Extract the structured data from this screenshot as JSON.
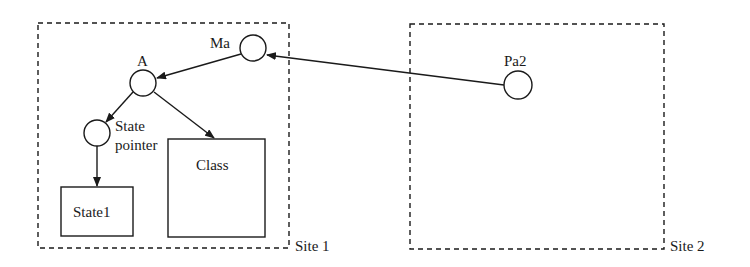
{
  "diagram": {
    "sites": [
      {
        "id": "site1",
        "label": "Site 1",
        "x": 38,
        "y": 23,
        "w": 251,
        "h": 225
      },
      {
        "id": "site2",
        "label": "Site 2",
        "x": 410,
        "y": 24,
        "w": 254,
        "h": 225
      }
    ],
    "nodes": [
      {
        "id": "ma",
        "label": "Ma",
        "shape": "circle",
        "cx": 253,
        "cy": 48,
        "r": 13
      },
      {
        "id": "a",
        "label": "A",
        "shape": "circle",
        "cx": 143,
        "cy": 83,
        "r": 13
      },
      {
        "id": "state_pointer",
        "label_line1": "State",
        "label_line2": "pointer",
        "shape": "circle",
        "cx": 97,
        "cy": 133,
        "r": 13
      },
      {
        "id": "pa2",
        "label": "Pa2",
        "shape": "circle",
        "cx": 518,
        "cy": 85,
        "r": 14
      },
      {
        "id": "state1",
        "label": "State1",
        "shape": "box",
        "x": 61,
        "y": 187,
        "w": 72,
        "h": 49
      },
      {
        "id": "class",
        "label": "Class",
        "shape": "box",
        "x": 168,
        "y": 139,
        "w": 97,
        "h": 98
      }
    ],
    "edges": [
      {
        "from": "pa2",
        "to": "ma"
      },
      {
        "from": "ma",
        "to": "a"
      },
      {
        "from": "a",
        "to": "state_pointer"
      },
      {
        "from": "a",
        "to": "class"
      },
      {
        "from": "state_pointer",
        "to": "state1"
      }
    ],
    "colors": {
      "stroke": "#1a1a1a",
      "background": "#ffffff"
    }
  }
}
